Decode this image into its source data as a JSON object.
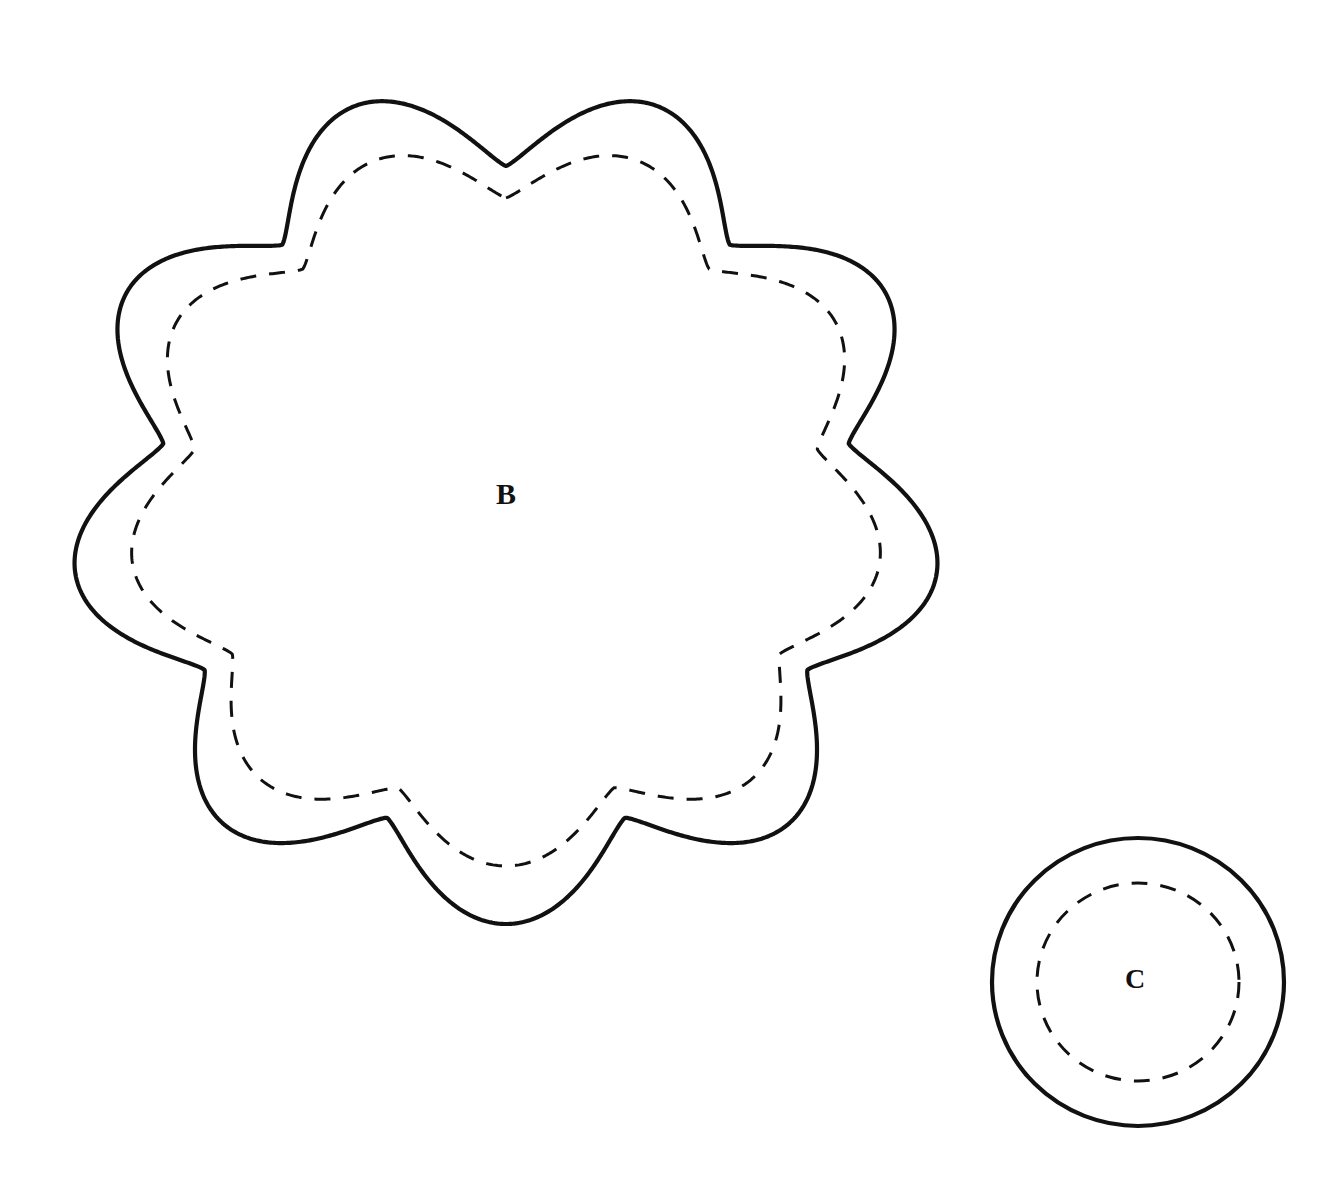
{
  "page": {
    "background_color": "#ffffff",
    "width": 1338,
    "height": 1198
  },
  "style": {
    "cut_line_color": "#111111",
    "cut_line_width": 4.2,
    "stitch_line_color": "#111111",
    "stitch_line_width": 3.0,
    "stitch_dash_pattern": "16 13",
    "label_color": "#111111"
  },
  "shapes": [
    {
      "id": "piece-b",
      "label": "B",
      "kind": "scalloped-circle",
      "petal_count": 9,
      "center": {
        "x": 506,
        "y": 502
      },
      "outer_radius_x": 437,
      "outer_radius_y": 422,
      "cusp_radius_x": 348,
      "cusp_radius_y": 336,
      "stitch_inset": 58,
      "label_position": {
        "x": 506,
        "y": 497
      },
      "label_font_size": 30
    },
    {
      "id": "piece-c",
      "label": "C",
      "kind": "circle",
      "center": {
        "x": 1138,
        "y": 982
      },
      "outer_radius_x": 146,
      "outer_radius_y": 144,
      "stitch_radius_x": 101,
      "stitch_radius_y": 99,
      "label_position": {
        "x": 1135,
        "y": 982
      },
      "label_font_size": 28
    }
  ],
  "labels": {
    "piece_b": "B",
    "piece_c": "C"
  }
}
